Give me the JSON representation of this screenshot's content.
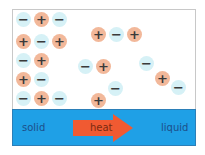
{
  "diagram": {
    "title": "",
    "labels": {
      "left": "solid",
      "arrow": "heat",
      "right": "liquid"
    },
    "colors": {
      "band": "#1fa0e6",
      "arrow": "#f05a32",
      "positive_ion": "#f2b89a",
      "negative_ion": "#d6f1f6"
    },
    "ions": [
      {
        "sign": "−",
        "type": "neg",
        "x": 16,
        "y": 12
      },
      {
        "sign": "+",
        "type": "pos",
        "x": 34,
        "y": 12
      },
      {
        "sign": "−",
        "type": "neg",
        "x": 52,
        "y": 12
      },
      {
        "sign": "+",
        "type": "pos",
        "x": 16,
        "y": 34
      },
      {
        "sign": "−",
        "type": "neg",
        "x": 34,
        "y": 34
      },
      {
        "sign": "+",
        "type": "pos",
        "x": 52,
        "y": 34
      },
      {
        "sign": "−",
        "type": "neg",
        "x": 16,
        "y": 53
      },
      {
        "sign": "+",
        "type": "pos",
        "x": 34,
        "y": 53
      },
      {
        "sign": "+",
        "type": "pos",
        "x": 16,
        "y": 72
      },
      {
        "sign": "−",
        "type": "neg",
        "x": 34,
        "y": 72
      },
      {
        "sign": "−",
        "type": "neg",
        "x": 16,
        "y": 91
      },
      {
        "sign": "+",
        "type": "pos",
        "x": 34,
        "y": 91
      },
      {
        "sign": "−",
        "type": "neg",
        "x": 52,
        "y": 91
      },
      {
        "sign": "+",
        "type": "pos",
        "x": 91,
        "y": 27
      },
      {
        "sign": "−",
        "type": "neg",
        "x": 109,
        "y": 27
      },
      {
        "sign": "+",
        "type": "pos",
        "x": 127,
        "y": 27
      },
      {
        "sign": "−",
        "type": "neg",
        "x": 78,
        "y": 59
      },
      {
        "sign": "+",
        "type": "pos",
        "x": 96,
        "y": 59
      },
      {
        "sign": "+",
        "type": "pos",
        "x": 91,
        "y": 93
      },
      {
        "sign": "−",
        "type": "neg",
        "x": 108,
        "y": 81
      },
      {
        "sign": "−",
        "type": "neg",
        "x": 139,
        "y": 56
      },
      {
        "sign": "+",
        "type": "pos",
        "x": 155,
        "y": 71
      },
      {
        "sign": "−",
        "type": "neg",
        "x": 171,
        "y": 80
      }
    ]
  }
}
